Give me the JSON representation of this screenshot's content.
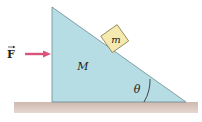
{
  "diagram": {
    "force_label": "F",
    "wedge_mass_label": "M",
    "block_mass_label": "m",
    "angle_label": "θ",
    "colors": {
      "wedge_fill": "#b5dde3",
      "wedge_stroke": "#6a8c92",
      "block_fill": "#f4eab0",
      "block_stroke": "#8a7d4a",
      "ground_fill": "#d8c4bb",
      "arrow": "#d9537c"
    }
  }
}
